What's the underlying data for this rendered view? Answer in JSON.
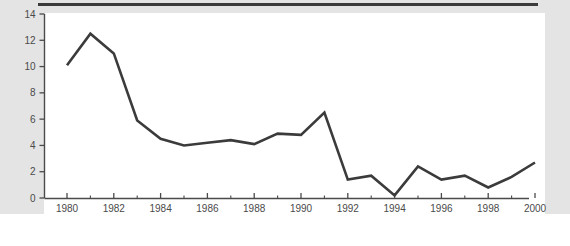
{
  "chart_data": {
    "type": "line",
    "title": "",
    "subtitle": "",
    "xlabel": "",
    "ylabel": "",
    "x": [
      1980,
      1981,
      1982,
      1983,
      1984,
      1985,
      1986,
      1987,
      1988,
      1989,
      1990,
      1991,
      1992,
      1993,
      1994,
      1995,
      1996,
      1997,
      1998,
      1999,
      2000
    ],
    "values": [
      10.1,
      12.5,
      11.0,
      5.9,
      4.5,
      4.0,
      4.2,
      4.4,
      4.1,
      4.9,
      4.8,
      6.5,
      1.4,
      1.7,
      0.2,
      2.4,
      1.4,
      1.7,
      0.8,
      1.6,
      2.7
    ],
    "series": [
      {
        "name": "series-1",
        "color": "#3b3b3b",
        "values": [
          10.1,
          12.5,
          11.0,
          5.9,
          4.5,
          4.0,
          4.2,
          4.4,
          4.1,
          4.9,
          4.8,
          6.5,
          1.4,
          1.7,
          0.2,
          2.4,
          1.4,
          1.7,
          0.8,
          1.6,
          2.7
        ]
      }
    ],
    "xlim": [
      1979.0,
      2000.9
    ],
    "ylim": [
      0,
      14
    ],
    "x_ticks": [
      1980,
      1982,
      1984,
      1986,
      1988,
      1990,
      1992,
      1994,
      1996,
      1998,
      2000
    ],
    "x_tick_labels": [
      "1980",
      "1982",
      "1984",
      "1986",
      "1988",
      "1990",
      "1992",
      "1994",
      "1996",
      "1998",
      "2000"
    ],
    "x_minor_ticks": [
      1981,
      1983,
      1985,
      1987,
      1989,
      1991,
      1993,
      1995,
      1997,
      1999
    ],
    "y_ticks": [
      0,
      2,
      4,
      6,
      8,
      10,
      12,
      14
    ],
    "y_tick_labels": [
      "0",
      "2",
      "4",
      "6",
      "8",
      "10",
      "12",
      "14"
    ],
    "grid": false,
    "legend": false,
    "legend_position": "none"
  },
  "style": {
    "line_color": "#3b3b3b",
    "axis_color": "#4a4a4a",
    "tick_label_color": "#4a4a4a",
    "plot_background": "#ffffff",
    "figure_background": "#e4e4e4",
    "rule_color": "#3b3b3b"
  }
}
